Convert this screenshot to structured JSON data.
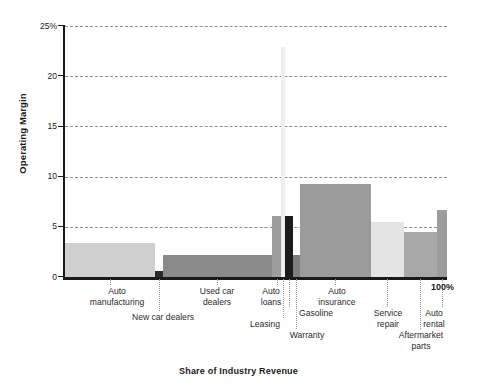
{
  "chart_data": {
    "type": "bar",
    "variant": "marimekko-variable-width",
    "title": "",
    "xlabel": "Share of Industry Revenue",
    "ylabel": "Operating Margin",
    "ylim": [
      0,
      25
    ],
    "ytick_labels": [
      "0",
      "5",
      "10",
      "15",
      "20",
      "25%"
    ],
    "ytick_values": [
      0,
      5,
      10,
      15,
      20,
      25
    ],
    "grid": true,
    "grid_axis": "y",
    "legend": "none",
    "x_axis_end_label": "100%",
    "categories": [
      "Auto manufacturing",
      "New car dealers",
      "Used car dealers",
      "Auto loans",
      "Leasing",
      "Gasoline",
      "Warranty",
      "Auto insurance",
      "Service repair",
      "Aftermarket parts",
      "Auto rental"
    ],
    "values": [
      3.4,
      0.6,
      2.2,
      6.1,
      22.9,
      6.1,
      2.2,
      9.3,
      5.5,
      4.5,
      6.7
    ],
    "widths_pct": [
      23.6,
      2.1,
      28.5,
      2.4,
      1.0,
      2.1,
      1.8,
      18.6,
      8.6,
      8.6,
      2.7
    ],
    "series": [
      {
        "name": "Operating Margin",
        "values": [
          3.4,
          0.6,
          2.2,
          6.1,
          22.9,
          6.1,
          2.2,
          9.3,
          5.5,
          4.5,
          6.7
        ]
      }
    ],
    "bars": [
      {
        "label": "Auto manufacturing",
        "value": 3.4,
        "x0": 0.0,
        "x1": 23.6,
        "color": "#cfcfcf"
      },
      {
        "label": "New car dealers",
        "value": 0.6,
        "x0": 23.6,
        "x1": 25.7,
        "color": "#2a2a2a"
      },
      {
        "label": "Used car dealers",
        "value": 2.2,
        "x0": 25.7,
        "x1": 54.2,
        "color": "#8a8a8a"
      },
      {
        "label": "Auto loans",
        "value": 6.1,
        "x0": 54.2,
        "x1": 56.6,
        "color": "#9d9d9d"
      },
      {
        "label": "Leasing",
        "value": 22.9,
        "x0": 56.6,
        "x1": 57.6,
        "color": "#efefef"
      },
      {
        "label": "Gasoline",
        "value": 6.1,
        "x0": 57.6,
        "x1": 59.7,
        "color": "#1c1c1c"
      },
      {
        "label": "Warranty",
        "value": 2.2,
        "x0": 59.7,
        "x1": 61.5,
        "color": "#7e7e7e"
      },
      {
        "label": "Auto insurance",
        "value": 9.3,
        "x0": 61.5,
        "x1": 80.1,
        "color": "#9b9b9b"
      },
      {
        "label": "Service repair",
        "value": 5.5,
        "x0": 80.1,
        "x1": 88.7,
        "color": "#e4e4e4"
      },
      {
        "label": "Aftermarket parts",
        "value": 4.5,
        "x0": 88.7,
        "x1": 97.3,
        "color": "#a8a8a8"
      },
      {
        "label": "Auto rental",
        "value": 6.7,
        "x0": 97.3,
        "x1": 100.0,
        "color": "#9d9d9d"
      }
    ],
    "colors": {
      "axis": "#1a1a1a",
      "grid": "#8d8d8d",
      "leader": "#9a9a9a",
      "label_text": "#2b2b2b",
      "background": "#ffffff"
    }
  },
  "labels": {
    "ylabel": "Operating Margin",
    "xlabel": "Share of Industry Revenue",
    "hundred_pct": "100%"
  },
  "category_labels": [
    {
      "text": "Auto\nmanufacturing",
      "anchor_pct": 11.8,
      "left": 80,
      "top": 286,
      "width": 74,
      "leader_top": 279,
      "leader_height": 6
    },
    {
      "text": "New car dealers",
      "anchor_pct": 24.6,
      "left": 113,
      "top": 312,
      "width": 100,
      "leader_top": 279,
      "leader_height": 32
    },
    {
      "text": "Used car\ndealers",
      "anchor_pct": 39.9,
      "left": 186,
      "top": 286,
      "width": 62,
      "leader_top": 279,
      "leader_height": 6
    },
    {
      "text": "Auto\nloans",
      "anchor_pct": 55.4,
      "left": 250,
      "top": 286,
      "width": 42,
      "leader_top": 279,
      "leader_height": 6
    },
    {
      "text": "Leasing",
      "anchor_pct": 57.1,
      "left": 239,
      "top": 319,
      "width": 52,
      "leader_top": 279,
      "leader_height": 39
    },
    {
      "text": "Gasoline",
      "anchor_pct": 58.6,
      "left": 288,
      "top": 308,
      "width": 56,
      "leader_top": 279,
      "leader_height": 28
    },
    {
      "text": "Warranty",
      "anchor_pct": 60.6,
      "left": 278,
      "top": 330,
      "width": 58,
      "leader_top": 279,
      "leader_height": 50
    },
    {
      "text": "Auto\ninsurance",
      "anchor_pct": 70.8,
      "left": 304,
      "top": 286,
      "width": 66,
      "leader_top": 279,
      "leader_height": 6
    },
    {
      "text": "Service\nrepair",
      "anchor_pct": 84.4,
      "left": 362,
      "top": 308,
      "width": 52,
      "leader_top": 279,
      "leader_height": 28
    },
    {
      "text": "Aftermarket\nparts",
      "anchor_pct": 93.0,
      "left": 383,
      "top": 330,
      "width": 76,
      "leader_top": 279,
      "leader_height": 50
    },
    {
      "text": "Auto\nrental",
      "anchor_pct": 98.6,
      "left": 411,
      "top": 308,
      "width": 46,
      "leader_top": 279,
      "leader_height": 28
    }
  ]
}
